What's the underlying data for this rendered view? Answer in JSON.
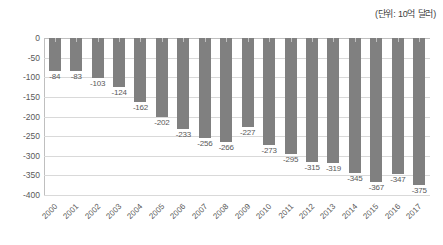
{
  "chart_data": {
    "type": "bar",
    "title": "",
    "subtitle": "",
    "unit_note": "(단위: 10억 달러)",
    "xlabel": "",
    "ylabel": "",
    "categories": [
      "2000",
      "2001",
      "2002",
      "2003",
      "2004",
      "2005",
      "2006",
      "2007",
      "2008",
      "2009",
      "2010",
      "2011",
      "2012",
      "2013",
      "2014",
      "2015",
      "2016",
      "2017"
    ],
    "values": [
      -84,
      -83,
      -103,
      -124,
      -162,
      -202,
      -233,
      -256,
      -266,
      -227,
      -273,
      -295,
      -315,
      -319,
      -345,
      -367,
      -347,
      -375
    ],
    "data_labels": [
      "-84",
      "-83",
      "-103",
      "-124",
      "-162",
      "-202",
      "-233",
      "-256",
      "-266",
      "-227",
      "-273",
      "-295",
      "-315",
      "-319",
      "-345",
      "-367",
      "-347",
      "-375"
    ],
    "ylim": [
      -400,
      0
    ],
    "ytick_values": [
      0,
      -50,
      -100,
      -150,
      -200,
      -250,
      -300,
      -350,
      -400
    ],
    "ytick_labels": [
      "0",
      "-50",
      "-100",
      "-150",
      "-200",
      "-250",
      "-300",
      "-350",
      "-400"
    ],
    "grid": true,
    "legend": false,
    "legend_position": "none",
    "bar_color": "#808080",
    "gridline_color": "#d9d9d9",
    "axis_color": "#bfbfbf",
    "text_color": "#595959",
    "background_color": "#ffffff"
  }
}
